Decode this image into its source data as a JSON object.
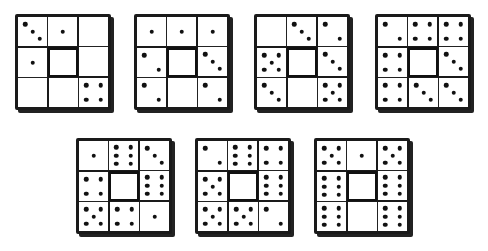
{
  "figure": {
    "puzzles": [
      {
        "id": 1,
        "x": 15,
        "y": 14,
        "dominoes": [
          {
            "pos": "top",
            "orient": "h",
            "pips": [
              3,
              1
            ]
          },
          {
            "pos": "right",
            "orient": "v",
            "pips": [
              0,
              0
            ]
          },
          {
            "pos": "bottom",
            "orient": "h",
            "pips": [
              0,
              4
            ]
          },
          {
            "pos": "left",
            "orient": "v",
            "pips": [
              1,
              0
            ]
          }
        ]
      },
      {
        "id": 2,
        "x": 134,
        "y": 14,
        "dominoes": [
          {
            "pos": "top",
            "orient": "h",
            "pips": [
              1,
              1
            ]
          },
          {
            "pos": "right",
            "orient": "v",
            "pips": [
              1,
              3
            ]
          },
          {
            "pos": "bottom",
            "orient": "h",
            "pips": [
              0,
              2
            ]
          },
          {
            "pos": "left",
            "orient": "v",
            "pips": [
              2,
              2
            ]
          }
        ]
      },
      {
        "id": 3,
        "x": 254,
        "y": 14,
        "dominoes": [
          {
            "pos": "top",
            "orient": "h",
            "pips": [
              0,
              3
            ]
          },
          {
            "pos": "right",
            "orient": "v",
            "pips": [
              2,
              3
            ]
          },
          {
            "pos": "bottom",
            "orient": "h",
            "pips": [
              0,
              5
            ]
          },
          {
            "pos": "left",
            "orient": "v",
            "pips": [
              5,
              3
            ]
          }
        ]
      },
      {
        "id": 4,
        "x": 375,
        "y": 14,
        "dominoes": [
          {
            "pos": "top",
            "orient": "h",
            "pips": [
              2,
              4
            ]
          },
          {
            "pos": "right",
            "orient": "v",
            "pips": [
              4,
              3
            ]
          },
          {
            "pos": "bottom",
            "orient": "h",
            "pips": [
              3,
              3
            ]
          },
          {
            "pos": "left",
            "orient": "v",
            "pips": [
              4,
              4
            ]
          }
        ]
      },
      {
        "id": 5,
        "x": 76,
        "y": 138,
        "dominoes": [
          {
            "pos": "top",
            "orient": "h",
            "pips": [
              1,
              6
            ]
          },
          {
            "pos": "right",
            "orient": "v",
            "pips": [
              3,
              6
            ]
          },
          {
            "pos": "bottom",
            "orient": "h",
            "pips": [
              4,
              1
            ]
          },
          {
            "pos": "left",
            "orient": "v",
            "pips": [
              4,
              5
            ]
          }
        ]
      },
      {
        "id": 6,
        "x": 195,
        "y": 138,
        "dominoes": [
          {
            "pos": "top",
            "orient": "h",
            "pips": [
              2,
              6
            ]
          },
          {
            "pos": "right",
            "orient": "v",
            "pips": [
              4,
              6
            ]
          },
          {
            "pos": "bottom",
            "orient": "h",
            "pips": [
              5,
              2
            ]
          },
          {
            "pos": "left",
            "orient": "v",
            "pips": [
              5,
              5
            ]
          }
        ]
      },
      {
        "id": 7,
        "x": 314,
        "y": 138,
        "dominoes": [
          {
            "pos": "top",
            "orient": "h",
            "pips": [
              5,
              1
            ]
          },
          {
            "pos": "right",
            "orient": "v",
            "pips": [
              5,
              6
            ]
          },
          {
            "pos": "bottom",
            "orient": "h",
            "pips": [
              0,
              6
            ]
          },
          {
            "pos": "left",
            "orient": "v",
            "pips": [
              6,
              6
            ]
          }
        ]
      }
    ]
  }
}
